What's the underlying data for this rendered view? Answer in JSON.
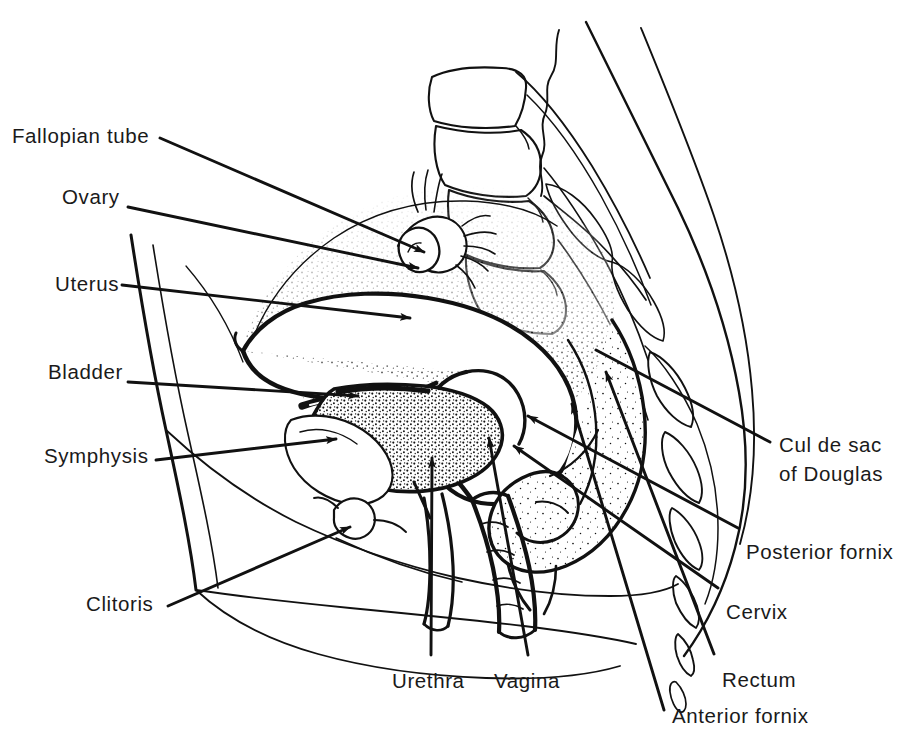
{
  "figure": {
    "background_color": "#ffffff",
    "ink_color": "#111111",
    "text_color": "#1a1a1a",
    "width": 897,
    "height": 750
  },
  "labels": [
    {
      "id": "fallopian-tube",
      "text": "Fallopian tube",
      "x": 12,
      "y": 124,
      "anchor": "left"
    },
    {
      "id": "ovary",
      "text": "Ovary",
      "x": 62,
      "y": 185,
      "anchor": "left"
    },
    {
      "id": "uterus",
      "text": "Uterus",
      "x": 55,
      "y": 272,
      "anchor": "left"
    },
    {
      "id": "bladder",
      "text": "Bladder",
      "x": 48,
      "y": 360,
      "anchor": "left"
    },
    {
      "id": "symphysis",
      "text": "Symphysis",
      "x": 44,
      "y": 444,
      "anchor": "left"
    },
    {
      "id": "clitoris",
      "text": "Clitoris",
      "x": 86,
      "y": 592,
      "anchor": "left"
    },
    {
      "id": "urethra",
      "text": "Urethra",
      "x": 392,
      "y": 669,
      "anchor": "left"
    },
    {
      "id": "vagina",
      "text": "Vagina",
      "x": 494,
      "y": 669,
      "anchor": "left"
    },
    {
      "id": "anterior-fornix",
      "text": "Anterior fornix",
      "x": 672,
      "y": 704,
      "anchor": "left"
    },
    {
      "id": "rectum",
      "text": "Rectum",
      "x": 722,
      "y": 668,
      "anchor": "left"
    },
    {
      "id": "cervix",
      "text": "Cervix",
      "x": 726,
      "y": 600,
      "anchor": "left"
    },
    {
      "id": "posterior-fornix",
      "text": "Posterior fornix",
      "x": 746,
      "y": 540,
      "anchor": "left"
    },
    {
      "id": "cul-de-sac-line1",
      "text": "Cul de sac",
      "x": 779,
      "y": 430,
      "anchor": "left"
    },
    {
      "id": "cul-de-sac-line2",
      "text": "of Douglas",
      "x": 779,
      "y": 461,
      "anchor": "left"
    }
  ],
  "structures": [
    {
      "id": "lumbar-vertebrae",
      "name": "Lumbar vertebrae"
    },
    {
      "id": "sacrum",
      "name": "Sacrum and coccyx"
    },
    {
      "id": "uterus-body",
      "name": "Uterus body with endometrial cavity"
    },
    {
      "id": "ovary-body",
      "name": "Ovary"
    },
    {
      "id": "fallopian-tube-body",
      "name": "Fallopian tube with fimbriae"
    },
    {
      "id": "bladder-body",
      "name": "Urinary bladder"
    },
    {
      "id": "pubic-symphysis",
      "name": "Pubic symphysis"
    },
    {
      "id": "rectum-body",
      "name": "Rectum"
    },
    {
      "id": "vaginal-canal",
      "name": "Vaginal canal"
    },
    {
      "id": "urethral-canal",
      "name": "Urethra"
    },
    {
      "id": "clitoris-body",
      "name": "Clitoris"
    },
    {
      "id": "abdominal-wall",
      "name": "Anterior abdominal wall"
    },
    {
      "id": "body-contour",
      "name": "Posterior body contour"
    },
    {
      "id": "perineum",
      "name": "Perineum and labia"
    }
  ]
}
